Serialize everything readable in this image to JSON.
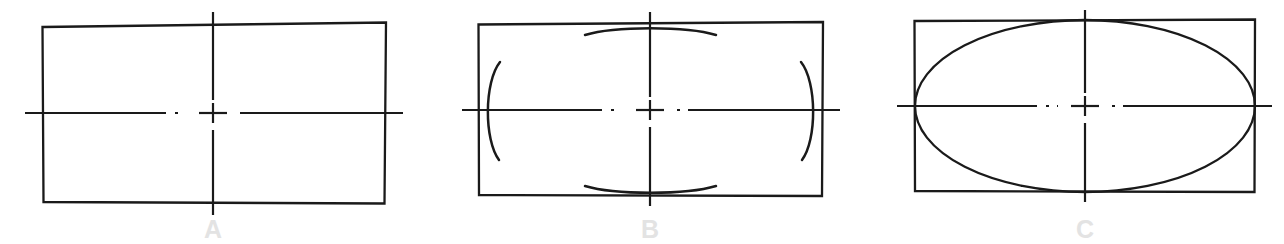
{
  "page": {
    "background_color": "#ffffff",
    "line_color": "#1a1a1a",
    "label_color": "#e3e3e3",
    "width": 1284,
    "height": 244
  },
  "figures": [
    {
      "id": "figure-a",
      "label": "A",
      "label_x": 213,
      "label_y": 238,
      "description": "Rectangle with horizontal and vertical centerlines",
      "rect": {
        "x": 42,
        "y": 25,
        "width": 343,
        "height": 178,
        "hand_drawn_path": "M 42.5 27.0 L 386.0 22.5 L 384.5 203.5 L 43.5 202.0 Z"
      },
      "center": {
        "x": 213,
        "y": 113
      },
      "centerline_horizontal": {
        "x1": 25,
        "x2": 403,
        "y": 113
      },
      "centerline_vertical": {
        "y1": 12,
        "y2": 215,
        "x": 213
      },
      "arcs": [],
      "ellipse": null
    },
    {
      "id": "figure-b",
      "label": "B",
      "label_x": 650,
      "label_y": 238,
      "description": "Rectangle with centerlines and four construction arcs tangent at the midpoints of each side",
      "rect": {
        "x": 478,
        "y": 23,
        "width": 345,
        "height": 173,
        "hand_drawn_path": "M 478.5 24.5 L 823.0 22.0 L 822.0 196.0 L 479.0 195.0 Z"
      },
      "center": {
        "x": 650,
        "y": 110
      },
      "centerline_horizontal": {
        "x1": 462,
        "x2": 840,
        "y": 110
      },
      "centerline_vertical": {
        "y1": 12,
        "y2": 206,
        "x": 650
      },
      "arcs": [
        {
          "name": "left-arc",
          "path": "M 500 62 C 484 82 484 140 499 160"
        },
        {
          "name": "right-arc",
          "path": "M 801 62 C 817 82 817 140 802 160"
        },
        {
          "name": "top-arc",
          "path": "M 585 35 C 615 26 686 26 716 35"
        },
        {
          "name": "bottom-arc",
          "path": "M 585 186 C 615 195 686 195 716 186"
        }
      ],
      "ellipse": null
    },
    {
      "id": "figure-c",
      "label": "C",
      "label_x": 1085,
      "label_y": 238,
      "description": "Rectangle with centerlines and the completed ellipse inscribed tangent to all four sides",
      "rect": {
        "x": 914,
        "y": 20,
        "width": 341,
        "height": 172,
        "hand_drawn_path": "M 914.5 21.0 L 1255.0 19.5 L 1254.5 192.0 L 915.0 191.0 Z"
      },
      "center": {
        "x": 1085,
        "y": 106
      },
      "centerline_horizontal": {
        "x1": 897,
        "x2": 1272,
        "y": 106
      },
      "centerline_vertical": {
        "y1": 10,
        "y2": 202,
        "x": 1085
      },
      "arcs": [],
      "ellipse": {
        "cx": 1085,
        "cy": 106,
        "rx": 170,
        "ry": 86
      }
    }
  ],
  "centerline_style": {
    "type": "dash-dot",
    "dash_pattern": "30 6 3 6",
    "center_cross_half_width": 14,
    "center_cross_half_height": 13,
    "center_gap": 9
  }
}
